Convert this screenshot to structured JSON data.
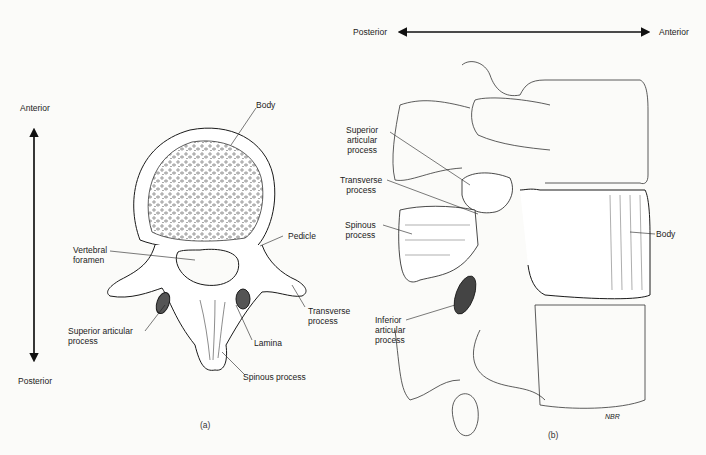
{
  "panel_a": {
    "caption": "(a)",
    "orientation": {
      "top": "Anterior",
      "bottom": "Posterior"
    },
    "labels": {
      "body": "Body",
      "pedicle": "Pedicle",
      "vertebral_foramen": "Vertebral\nforamen",
      "transverse_process": "Transverse\nprocess",
      "superior_articular_process": "Superior articular\nprocess",
      "lamina": "Lamina",
      "spinous_process": "Spinous process"
    }
  },
  "panel_b": {
    "caption": "(b)",
    "orientation": {
      "left": "Posterior",
      "right": "Anterior"
    },
    "labels": {
      "superior_articular_process": "Superior\narticular\nprocess",
      "transverse_process": "Transverse\nprocess",
      "spinous_process": "Spinous\nprocess",
      "inferior_articular_process": "Inferior\narticular\nprocess",
      "body": "Body"
    },
    "signature": "NBR"
  },
  "colors": {
    "ink": "#1a1a1a",
    "paper": "#fbfbf9",
    "shade": "#555555"
  }
}
